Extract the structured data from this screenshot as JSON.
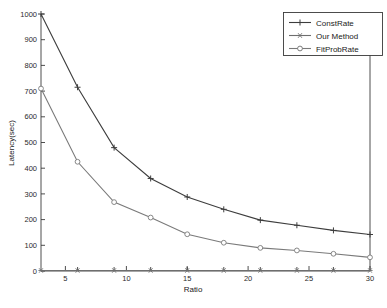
{
  "chart_data": {
    "type": "line",
    "title": "",
    "xlabel": "Ratio",
    "ylabel": "Latency(sec)",
    "xlim": [
      3,
      30
    ],
    "ylim": [
      0,
      1000
    ],
    "grid": false,
    "legend_position": "top-right",
    "x": [
      3,
      6,
      9,
      12,
      15,
      18,
      21,
      24,
      27,
      30
    ],
    "xticks": [
      5,
      10,
      15,
      20,
      25,
      30
    ],
    "yticks": [
      0,
      100,
      200,
      300,
      400,
      500,
      600,
      700,
      800,
      900,
      1000
    ],
    "series": [
      {
        "name": "ConstRate",
        "marker": "plus",
        "color": "#3d3d3d",
        "values": [
          1000,
          715,
          480,
          360,
          288,
          240,
          198,
          178,
          158,
          142
        ]
      },
      {
        "name": "Our Method",
        "marker": "star",
        "color": "#6e6e6e",
        "values": [
          2,
          2,
          2,
          2,
          2,
          2,
          2,
          2,
          2,
          2
        ]
      },
      {
        "name": "FitProbRate",
        "marker": "circle",
        "color": "#7a7a7a",
        "values": [
          710,
          425,
          268,
          208,
          143,
          110,
          90,
          80,
          67,
          53
        ]
      }
    ]
  },
  "axes": {
    "ylabel": "Latency(sec)",
    "xlabel": "Ratio",
    "ytick_labels": [
      "0",
      "100",
      "200",
      "300",
      "400",
      "500",
      "600",
      "700",
      "800",
      "900",
      "1000"
    ],
    "xtick_labels": [
      "5",
      "10",
      "15",
      "20",
      "25",
      "30"
    ]
  },
  "legend": {
    "items": [
      {
        "label": "ConstRate"
      },
      {
        "label": "Our Method"
      },
      {
        "label": "FitProbRate"
      }
    ]
  }
}
